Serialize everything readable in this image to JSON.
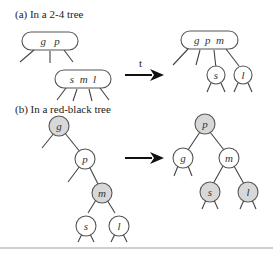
{
  "section_a": {
    "label": "(a) In a 2-4 tree",
    "before": {
      "parent_keys": "g   p",
      "child_keys": "s  m  l"
    },
    "arrow_label": "t",
    "after": {
      "parent_keys": "g  p  m",
      "child_left": "s",
      "child_right": "l"
    }
  },
  "section_b": {
    "label": "(b) In a red-black tree",
    "before": {
      "nodes": [
        "g",
        "p",
        "m",
        "s",
        "l"
      ],
      "gray_nodes": [
        "g",
        "m"
      ]
    },
    "after": {
      "nodes": [
        "p",
        "g",
        "m",
        "s",
        "l"
      ],
      "gray_nodes": [
        "p",
        "s",
        "l"
      ]
    }
  },
  "colors": {
    "gray_node": "#d8d8d8",
    "white_node": "#ffffff",
    "stroke": "#555555"
  }
}
